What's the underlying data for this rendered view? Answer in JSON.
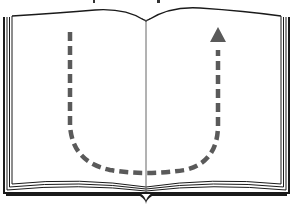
{
  "figure": {
    "colors": {
      "background": "#ffffff",
      "outline": "#1a1a1a",
      "page_lines": "#555555",
      "arrow": "#5a5a5a"
    },
    "arrow": {
      "style": "dashed",
      "direction": "down-left-then-up-right",
      "head": "triangle-up"
    }
  }
}
